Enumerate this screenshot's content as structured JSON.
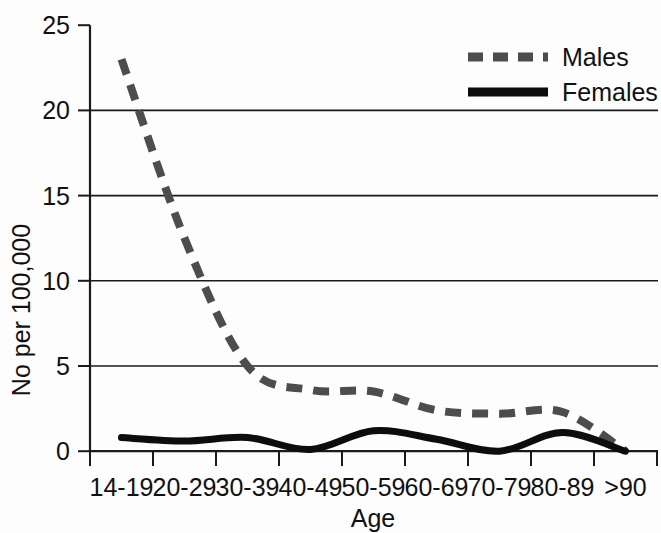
{
  "chart_data": {
    "type": "line",
    "title": "",
    "xlabel": "Age",
    "ylabel": "No per 100,000",
    "categories": [
      "14-19",
      "20-29",
      "30-39",
      "40-49",
      "50-59",
      "60-69",
      "70-79",
      "80-89",
      ">90"
    ],
    "ylim": [
      0,
      25
    ],
    "yticks": [
      0,
      5,
      10,
      15,
      20,
      25
    ],
    "ytick_labels": [
      "0",
      "5",
      "10",
      "15",
      "20",
      "25"
    ],
    "grid": "horizontal",
    "legend_position": "top-right",
    "series": [
      {
        "name": "Males",
        "style": "dashed",
        "color": "#4d4d4d",
        "values": [
          23.0,
          12.5,
          5.0,
          3.6,
          3.5,
          2.4,
          2.2,
          2.3,
          0.0
        ]
      },
      {
        "name": "Females",
        "style": "solid",
        "color": "#0d0d0d",
        "values": [
          0.8,
          0.6,
          0.8,
          0.1,
          1.2,
          0.7,
          0.0,
          1.1,
          0.0
        ]
      }
    ]
  },
  "axes": {
    "y_axis_label": "No per 100,000",
    "x_axis_label": "Age",
    "y_tick_0": "0",
    "y_tick_5": "5",
    "y_tick_10": "10",
    "y_tick_15": "15",
    "y_tick_20": "20",
    "y_tick_25": "25",
    "x_tick_0": "14-19",
    "x_tick_1": "20-29",
    "x_tick_2": "30-39",
    "x_tick_3": "40-49",
    "x_tick_4": "50-59",
    "x_tick_5": "60-69",
    "x_tick_6": "70-79",
    "x_tick_7": "80-89",
    "x_tick_8": ">90"
  },
  "legend": {
    "males_label": "Males",
    "females_label": "Females"
  },
  "colors": {
    "males": "#4d4d4d",
    "females": "#0d0d0d",
    "axis": "#1a1a1a",
    "background": "#fdfdfd"
  }
}
